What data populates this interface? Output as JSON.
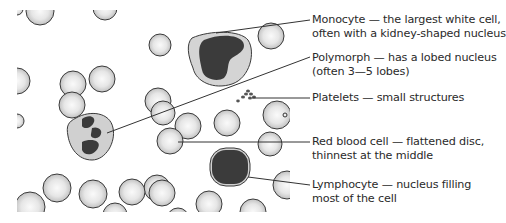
{
  "diagram": {
    "colors": {
      "background": "#ffffff",
      "red_cell_fill": "#d9d9d9",
      "red_cell_highlight": "#f7f7f7",
      "cell_outline": "#3a3a3a",
      "wbc_cytoplasm": "#cfcfcf",
      "nucleus": "#3b3b3b",
      "leader_line": "#333333",
      "text": "#2a2a2a"
    },
    "labels": [
      {
        "id": "monocyte",
        "line1": "Monocyte — the largest white cell,",
        "line2": "often with a kidney-shaped nucleus"
      },
      {
        "id": "polymorph",
        "line1": "Polymorph — has a lobed nucleus",
        "line2": "(often 3—5 lobes)"
      },
      {
        "id": "platelets",
        "line1": "Platelets — small structures",
        "line2": ""
      },
      {
        "id": "red-blood-cell",
        "line1": "Red blood cell — flattened disc,",
        "line2": "thinnest at the middle"
      },
      {
        "id": "lymphocyte",
        "line1": "Lymphocyte — nucleus filling",
        "line2": "most of the cell"
      }
    ]
  }
}
